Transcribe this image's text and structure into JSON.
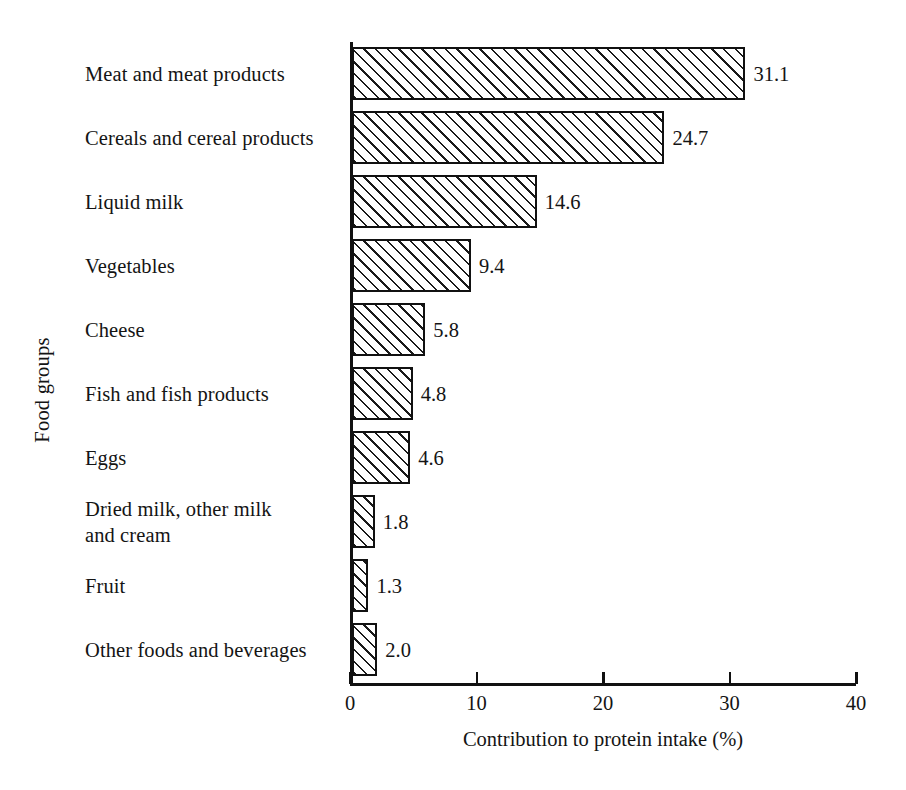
{
  "chart_data": {
    "type": "bar",
    "orientation": "horizontal",
    "title": "",
    "xlabel": "Contribution to protein intake (%)",
    "ylabel": "Food groups",
    "xlim": [
      0,
      40
    ],
    "xticks": [
      0,
      10,
      20,
      30,
      40
    ],
    "xtick_labels": [
      "0",
      "10",
      "20",
      "30",
      "40"
    ],
    "grid": false,
    "legend": null,
    "categories": [
      "Meat and meat products",
      "Cereals and cereal products",
      "Liquid milk",
      "Vegetables",
      "Cheese",
      "Fish and fish products",
      "Eggs",
      "Dried milk, other milk\nand cream",
      "Fruit",
      "Other foods and beverages"
    ],
    "values": [
      31.1,
      24.7,
      14.6,
      9.4,
      5.8,
      4.8,
      4.6,
      1.8,
      1.3,
      2.0
    ],
    "value_labels": [
      "31.1",
      "24.7",
      "14.6",
      "9.4",
      "5.8",
      "4.8",
      "4.6",
      "1.8",
      "1.3",
      "2.0"
    ],
    "bar_style": {
      "fill": "#ffffff",
      "hatch": "diagonal-45",
      "hatch_color": "#1a1a1a",
      "edge_color": "#111111"
    }
  },
  "axes": {
    "x_title": "Contribution to protein intake (%)",
    "y_title": "Food groups"
  }
}
